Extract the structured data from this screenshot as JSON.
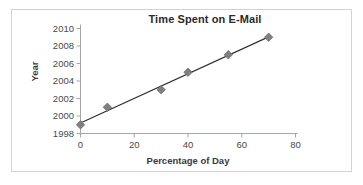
{
  "chart_data": {
    "type": "scatter",
    "title": "Time Spent on E-Mail",
    "xlabel": "Percentage of Day",
    "ylabel": "Year",
    "x": [
      0,
      10,
      30,
      40,
      55,
      70
    ],
    "y": [
      1999,
      2001,
      2003,
      2005,
      2007,
      2009
    ],
    "points": [
      {
        "x": 0,
        "y": 1999
      },
      {
        "x": 10,
        "y": 2001
      },
      {
        "x": 30,
        "y": 2003
      },
      {
        "x": 40,
        "y": 2005
      },
      {
        "x": 55,
        "y": 2007
      },
      {
        "x": 70,
        "y": 2009
      }
    ],
    "xlim": [
      0,
      80
    ],
    "ylim": [
      1998,
      2010
    ],
    "xticks": [
      0,
      20,
      40,
      60,
      80
    ],
    "yticks": [
      1998,
      2000,
      2002,
      2004,
      2006,
      2008,
      2010
    ],
    "xtick_labels": [
      "0",
      "20",
      "40",
      "60",
      "80"
    ],
    "ytick_labels": [
      "1998",
      "2000",
      "2002",
      "2004",
      "2006",
      "2008",
      "2010"
    ],
    "grid": false,
    "legend": null,
    "trendline": true,
    "marker": "diamond",
    "marker_color": "#808080",
    "line_color": "#2f2f2f",
    "axis_color": "#a6a6a6",
    "border_color": "#d3d3d3",
    "background": "#ffffff"
  },
  "axis": {
    "x_title": "Percentage of Day",
    "y_title": "Year"
  },
  "header": {
    "title": "Time Spent on E-Mail"
  }
}
